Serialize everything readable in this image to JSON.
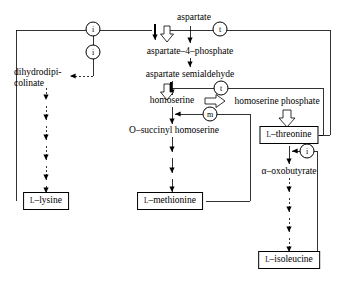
{
  "diagram": {
    "metabolites": [
      {
        "id": "aspartate",
        "text": "aspartate",
        "x": 194,
        "y": 18,
        "boxed": false
      },
      {
        "id": "aspartate-4-phosphate",
        "text": "aspartate–4–phosphate",
        "x": 190,
        "y": 52,
        "boxed": false
      },
      {
        "id": "aspartate-semialdehyde",
        "text": "aspartate semialdehyde",
        "x": 190,
        "y": 75,
        "boxed": false
      },
      {
        "id": "homoserine",
        "text": "homoserine",
        "x": 172,
        "y": 101,
        "boxed": false
      },
      {
        "id": "homoserine-phosphate",
        "text": "homoserine phosphate",
        "x": 277,
        "y": 102,
        "boxed": false
      },
      {
        "id": "o-succinyl-homoserine",
        "text": "O–succinyl homoserine",
        "x": 174,
        "y": 131,
        "boxed": false
      },
      {
        "id": "alpha-oxobutyrate",
        "text": "α–oxobutyrate",
        "x": 289,
        "y": 172,
        "boxed": false
      }
    ],
    "dihydrodipicolinate": {
      "line1": "dihydrodipi-",
      "line2": "colinate",
      "x": 22,
      "y": 73
    },
    "products": [
      {
        "id": "l-threonine",
        "prefix": "L",
        "name": "–threonine",
        "x": 289,
        "y": 135
      },
      {
        "id": "l-lysine",
        "prefix": "L",
        "name": "–lysine",
        "x": 46,
        "y": 201
      },
      {
        "id": "l-methionine",
        "prefix": "L",
        "name": "–methionine",
        "x": 170,
        "y": 201
      },
      {
        "id": "l-isoleucine",
        "prefix": "L",
        "name": "–isoleucine",
        "x": 289,
        "y": 260
      }
    ],
    "regulator_nodes": [
      {
        "id": "node-i-top-left",
        "letter": "i",
        "x": 93,
        "y": 29
      },
      {
        "id": "node-t-top-right",
        "letter": "t",
        "x": 220,
        "y": 29
      },
      {
        "id": "node-i-dhdp",
        "letter": "i",
        "x": 93,
        "y": 52
      },
      {
        "id": "node-t-homoserine",
        "letter": "t",
        "x": 221,
        "y": 88
      },
      {
        "id": "node-m-methionine",
        "letter": "m",
        "x": 210,
        "y": 114
      },
      {
        "id": "node-i-threonine",
        "letter": "i",
        "x": 307,
        "y": 151
      }
    ],
    "legend_keys": {
      "i": "isoleucine-sensitive regulation",
      "t": "threonine-sensitive regulation",
      "m": "methionine-sensitive regulation"
    },
    "colors": {
      "stroke": "#000000",
      "background": "#ffffff",
      "text": "#000000"
    }
  }
}
